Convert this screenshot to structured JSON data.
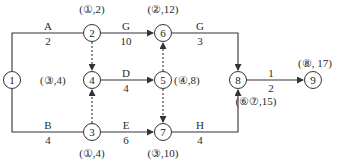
{
  "nodes": [
    {
      "id": "1",
      "x": 12,
      "y": 80,
      "label": ""
    },
    {
      "id": "2",
      "x": 92,
      "y": 33,
      "label": "(①,2)"
    },
    {
      "id": "3",
      "x": 92,
      "y": 132,
      "label": "(①,4)"
    },
    {
      "id": "4",
      "x": 92,
      "y": 80,
      "label": "(③,4)"
    },
    {
      "id": "5",
      "x": 163,
      "y": 80,
      "label": "(④,8)"
    },
    {
      "id": "6",
      "x": 163,
      "y": 33,
      "label": "(②,12)"
    },
    {
      "id": "7",
      "x": 163,
      "y": 132,
      "label": "(③,10)"
    },
    {
      "id": "8",
      "x": 238,
      "y": 80,
      "label": "(⑥⑦,15)"
    },
    {
      "id": "9",
      "x": 313,
      "y": 80,
      "label": "(⑧, 17)"
    }
  ],
  "activities": [
    {
      "from": "1",
      "to": "2",
      "name": "A",
      "duration": "2"
    },
    {
      "from": "1",
      "to": "3",
      "name": "B",
      "duration": "4"
    },
    {
      "from": "2",
      "to": "6",
      "name": "G",
      "duration": "10"
    },
    {
      "from": "4",
      "to": "5",
      "name": "D",
      "duration": "4"
    },
    {
      "from": "3",
      "to": "7",
      "name": "E",
      "duration": "6"
    },
    {
      "from": "6",
      "to": "8",
      "name": "G",
      "duration": "3"
    },
    {
      "from": "7",
      "to": "8",
      "name": "H",
      "duration": "4"
    },
    {
      "from": "8",
      "to": "9",
      "name": "1",
      "duration": "2"
    }
  ],
  "dummies": [
    {
      "from": "2",
      "to": "4"
    },
    {
      "from": "3",
      "to": "4"
    },
    {
      "from": "5",
      "to": "6"
    },
    {
      "from": "5",
      "to": "7"
    }
  ],
  "colors": {
    "line": "#333333",
    "text": "#2a2a2a"
  }
}
